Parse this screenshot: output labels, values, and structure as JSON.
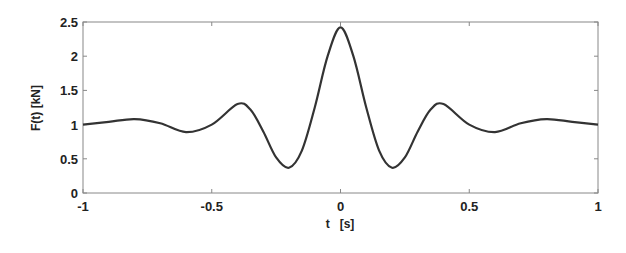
{
  "chart_data": {
    "type": "line",
    "title": "",
    "xlabel": "t   [s]",
    "ylabel": "F(t)   [kN]",
    "xlim": [
      -1,
      1
    ],
    "ylim": [
      0,
      2.5
    ],
    "grid": false,
    "legend": null,
    "x_ticks": [
      -1,
      -0.5,
      0,
      0.5,
      1
    ],
    "x_tick_labels": [
      "-1",
      "-0.5",
      "0",
      "0.5",
      "1"
    ],
    "y_ticks": [
      0,
      0.5,
      1,
      1.5,
      2,
      2.5
    ],
    "y_tick_labels": [
      "0",
      "0.5",
      "1",
      "1.5",
      "2",
      "2.5"
    ],
    "series": [
      {
        "name": "F(t)",
        "color": "#333333",
        "x": [
          -1.0,
          -0.9,
          -0.8,
          -0.7,
          -0.6,
          -0.5,
          -0.4,
          -0.35,
          -0.3,
          -0.25,
          -0.2,
          -0.15,
          -0.1,
          -0.05,
          0.0,
          0.05,
          0.1,
          0.15,
          0.2,
          0.25,
          0.3,
          0.35,
          0.4,
          0.5,
          0.6,
          0.7,
          0.8,
          0.9,
          1.0
        ],
        "y": [
          1.0,
          1.04,
          1.08,
          1.02,
          0.89,
          1.0,
          1.3,
          1.22,
          0.9,
          0.52,
          0.37,
          0.62,
          1.25,
          2.0,
          2.42,
          2.0,
          1.25,
          0.62,
          0.37,
          0.52,
          0.9,
          1.22,
          1.3,
          1.0,
          0.89,
          1.02,
          1.08,
          1.04,
          1.0
        ]
      }
    ]
  }
}
